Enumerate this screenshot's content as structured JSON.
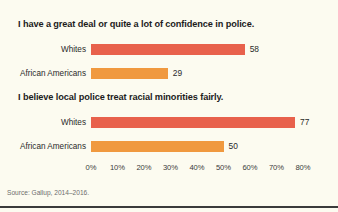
{
  "figure": {
    "background_color": "#fcfbf0",
    "source_note": "Source: Gallup, 2014–2016."
  },
  "colors": {
    "whites_bar": "#e8614c",
    "african_americans_bar": "#f0993f",
    "title_text": "#1c1c1c",
    "label_text": "#2a2a2a",
    "source_text": "#6d6d6d",
    "rule": "#3b3b3b"
  },
  "panels": [
    {
      "title": "I have a great deal or quite a lot of confidence in police.",
      "rows": [
        {
          "label": "Whites",
          "value": 58,
          "value_text": "58",
          "color_key": "whites_bar"
        },
        {
          "label": "African Americans",
          "value": 29,
          "value_text": "29",
          "color_key": "african_americans_bar"
        }
      ]
    },
    {
      "title": "I believe local police treat racial minorities fairly.",
      "rows": [
        {
          "label": "Whites",
          "value": 77,
          "value_text": "77",
          "color_key": "whites_bar"
        },
        {
          "label": "African Americans",
          "value": 50,
          "value_text": "50",
          "color_key": "african_americans_bar"
        }
      ]
    }
  ],
  "axis": {
    "ticks": [
      "0%",
      "10%",
      "20%",
      "30%",
      "40%",
      "50%",
      "60%",
      "70%",
      "80%"
    ],
    "min": 0,
    "max": 80
  },
  "chart_data": {
    "type": "bar",
    "orientation": "horizontal",
    "title": "",
    "xlabel": "",
    "ylabel": "",
    "xlim": [
      0,
      80
    ],
    "grid": false,
    "legend": "none",
    "source": "Source: Gallup, 2014–2016.",
    "tick_labels": [
      "0%",
      "10%",
      "20%",
      "30%",
      "40%",
      "50%",
      "60%",
      "70%",
      "80%"
    ],
    "panels": [
      {
        "title": "I have a great deal or quite a lot of confidence in police.",
        "categories": [
          "Whites",
          "African Americans"
        ],
        "values": [
          58,
          29
        ],
        "colors": [
          "#e8614c",
          "#f0993f"
        ]
      },
      {
        "title": "I believe local police treat racial minorities fairly.",
        "categories": [
          "Whites",
          "African Americans"
        ],
        "values": [
          77,
          50
        ],
        "colors": [
          "#e8614c",
          "#f0993f"
        ]
      }
    ]
  }
}
